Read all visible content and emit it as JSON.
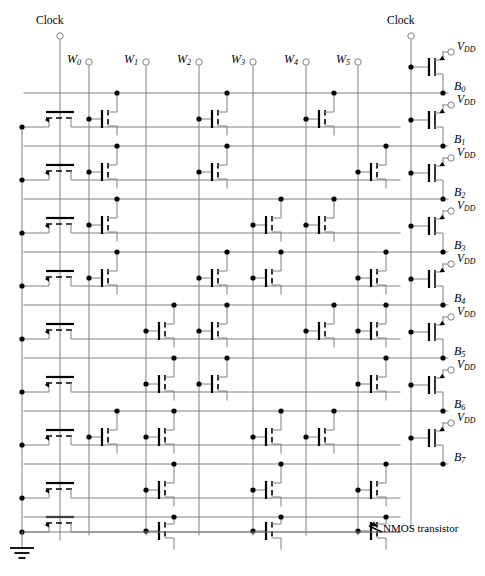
{
  "figure": {
    "kind": "circuit-schematic"
  },
  "labels": {
    "clock_left": "Clock",
    "clock_right": "Clock",
    "vdd": "V",
    "vdd_sub": "DD",
    "note": "NMOS transistor"
  },
  "word_lines": [
    {
      "name": "W",
      "sub": "0",
      "x": 89
    },
    {
      "name": "W",
      "sub": "1",
      "x": 146
    },
    {
      "name": "W",
      "sub": "2",
      "x": 199
    },
    {
      "name": "W",
      "sub": "3",
      "x": 253
    },
    {
      "name": "W",
      "sub": "4",
      "x": 306
    },
    {
      "name": "W",
      "sub": "5",
      "x": 358
    }
  ],
  "bit_lines": [
    {
      "name": "B",
      "sub": "0",
      "y": 93
    },
    {
      "name": "B",
      "sub": "1",
      "y": 146
    },
    {
      "name": "B",
      "sub": "2",
      "y": 199
    },
    {
      "name": "B",
      "sub": "3",
      "y": 252
    },
    {
      "name": "B",
      "sub": "4",
      "y": 305
    },
    {
      "name": "B",
      "sub": "5",
      "y": 358
    },
    {
      "name": "B",
      "sub": "6",
      "y": 411
    },
    {
      "name": "B",
      "sub": "7",
      "y": 464
    }
  ],
  "geometry": {
    "gnd_rail_x": 22,
    "clock_left_x": 60,
    "clock_right_x": 411,
    "clock_left_top_y": 36,
    "clock_right_top_y": 36,
    "pmos_x": 432,
    "bit_label_x": 452,
    "row_pitch": 53,
    "first_row_y": 93,
    "rows": 8,
    "bottom_row_y": 517,
    "array_right_x": 400,
    "gnd_y": 548
  },
  "colors": {
    "wire": "#808080",
    "device": "#000000",
    "background": "#ffffff"
  },
  "clock_nmos_rows": [
    {
      "y": 119
    },
    {
      "y": 172
    },
    {
      "y": 225
    },
    {
      "y": 278
    },
    {
      "y": 331
    },
    {
      "y": 384
    },
    {
      "y": 437
    },
    {
      "y": 490
    },
    {
      "y": 524
    }
  ],
  "rom_cells": [
    {
      "row": 0,
      "col": 0
    },
    {
      "row": 0,
      "col": 2
    },
    {
      "row": 0,
      "col": 4
    },
    {
      "row": 1,
      "col": 0
    },
    {
      "row": 1,
      "col": 2
    },
    {
      "row": 1,
      "col": 5
    },
    {
      "row": 2,
      "col": 0
    },
    {
      "row": 2,
      "col": 3
    },
    {
      "row": 2,
      "col": 4
    },
    {
      "row": 3,
      "col": 0
    },
    {
      "row": 3,
      "col": 2
    },
    {
      "row": 3,
      "col": 3
    },
    {
      "row": 3,
      "col": 5
    },
    {
      "row": 4,
      "col": 1
    },
    {
      "row": 4,
      "col": 2
    },
    {
      "row": 4,
      "col": 4
    },
    {
      "row": 4,
      "col": 5
    },
    {
      "row": 5,
      "col": 1
    },
    {
      "row": 5,
      "col": 2
    },
    {
      "row": 5,
      "col": 5
    },
    {
      "row": 6,
      "col": 0
    },
    {
      "row": 6,
      "col": 1
    },
    {
      "row": 6,
      "col": 3
    },
    {
      "row": 6,
      "col": 4
    },
    {
      "row": 7,
      "col": 1
    },
    {
      "row": 7,
      "col": 3
    },
    {
      "row": 7,
      "col": 5
    }
  ],
  "pmos_rows": [
    0,
    1,
    2,
    3,
    4,
    5,
    6,
    7
  ]
}
